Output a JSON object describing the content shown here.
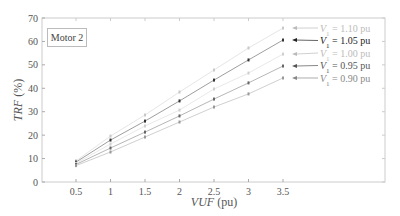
{
  "chart_data": {
    "type": "line",
    "title": "",
    "annotation": "Motor 2",
    "xlabel": "VUF (pu)",
    "ylabel": "TRF (%)",
    "xlim": [
      0,
      5.0
    ],
    "ylim": [
      0,
      70
    ],
    "x_ticks": [
      0.5,
      1,
      1.5,
      2,
      2.5,
      3,
      3.5
    ],
    "x_tick_labels": [
      "0.5",
      "1",
      "1.5",
      "2",
      "2.5",
      "3",
      "3.5"
    ],
    "y_ticks": [
      0,
      10,
      20,
      30,
      40,
      50,
      60,
      70
    ],
    "y_tick_labels": [
      "0",
      "10",
      "20",
      "30",
      "40",
      "50",
      "60",
      "70"
    ],
    "grid": false,
    "legend_position": "right, annotated with arrows",
    "x": [
      0.5,
      1,
      1.5,
      2,
      2.5,
      3,
      3.5
    ],
    "series": [
      {
        "name": "V1 = 1.10 pu",
        "color": "#c8c8c8",
        "values": [
          9.0,
          19.6,
          28.6,
          38.4,
          47.8,
          57.2,
          65.7
        ]
      },
      {
        "name": "V1 = 1.05 pu",
        "color": "#333333",
        "values": [
          8.5,
          17.9,
          26.0,
          34.6,
          43.5,
          52.1,
          60.6
        ]
      },
      {
        "name": "V1 = 1.00 pu",
        "color": "#cfcfcf",
        "values": [
          8.0,
          16.2,
          23.9,
          30.7,
          39.7,
          46.5,
          54.6
        ]
      },
      {
        "name": "V1 = 0.95 pu",
        "color": "#666666",
        "values": [
          7.5,
          14.5,
          21.3,
          28.2,
          35.4,
          42.3,
          49.5
        ]
      },
      {
        "name": "V1 = 0.90 pu",
        "color": "#999999",
        "values": [
          7.0,
          12.8,
          19.2,
          25.6,
          32.0,
          37.6,
          44.4
        ]
      }
    ]
  },
  "legend": [
    {
      "prefix": "V",
      "sub": "1",
      "suffix": " = 1.10 pu",
      "color": "#bbbbbb"
    },
    {
      "prefix": "V",
      "sub": "1",
      "suffix": " = 1.05 pu",
      "color": "#222222"
    },
    {
      "prefix": "V",
      "sub": "1",
      "suffix": " = 1.00 pu",
      "color": "#bbbbbb"
    },
    {
      "prefix": "V",
      "sub": "1",
      "suffix": " = 0.95 pu",
      "color": "#555555"
    },
    {
      "prefix": "V",
      "sub": "1",
      "suffix": " = 0.90 pu",
      "color": "#888888"
    }
  ],
  "labels": {
    "motor": "Motor 2",
    "xlabel_italic": "VUF",
    "xlabel_unit": " (pu)",
    "ylabel_italic": "TRF",
    "ylabel_unit": " (%)"
  }
}
